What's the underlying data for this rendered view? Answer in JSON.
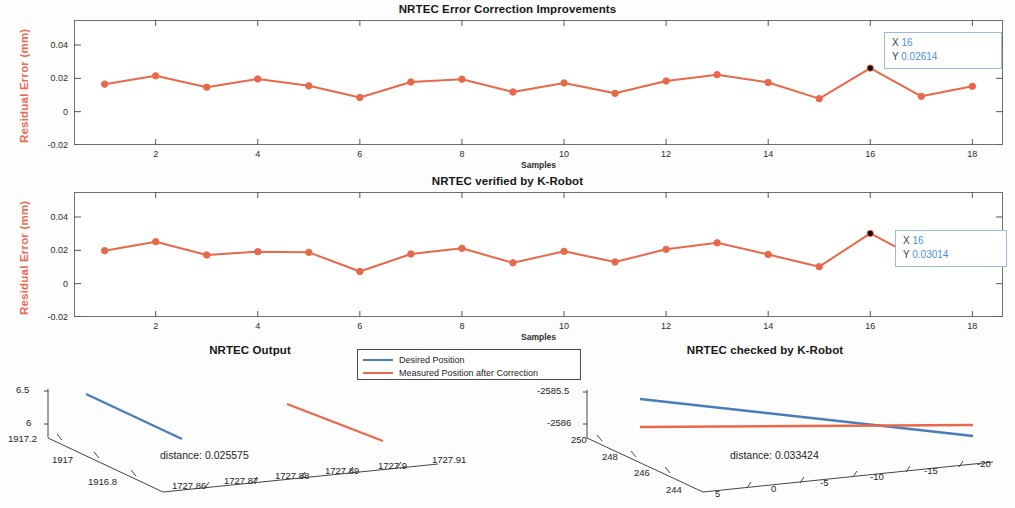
{
  "figure": {
    "width": 1015,
    "height": 508,
    "background": "#ffffff"
  },
  "colors": {
    "measured": "#e8684a",
    "desired": "#4a7ebb",
    "ylabel": "#eb6a52",
    "datatip_value": "#4a90d9",
    "axis": "#6f6f6f"
  },
  "legend": {
    "items": [
      {
        "label": "Desired Position",
        "color": "#4a7ebb"
      },
      {
        "label": "Measured Position after Correction",
        "color": "#e8684a"
      }
    ]
  },
  "chart_data": [
    {
      "type": "line",
      "id": "nrtec-error-correction",
      "title": "NRTEC Error Correction Improvements",
      "xlabel": "Samples",
      "ylabel": "Residual Error (mm)",
      "xlim": [
        0.4,
        18.6
      ],
      "ylim": [
        -0.02,
        0.055
      ],
      "xticks": [
        2,
        4,
        6,
        8,
        10,
        12,
        14,
        16,
        18
      ],
      "yticks": [
        0.04,
        0.02,
        0,
        -0.02
      ],
      "ytick_labels": [
        "0.04",
        "0.02",
        "0",
        "-0.02"
      ],
      "grid": false,
      "series": [
        {
          "name": "Residual Error",
          "color": "#e8684a",
          "marker": "o",
          "x": [
            1,
            2,
            3,
            4,
            5,
            6,
            7,
            8,
            9,
            10,
            11,
            12,
            13,
            14,
            15,
            16,
            17,
            18
          ],
          "values": [
            0.0165,
            0.0215,
            0.0147,
            0.0196,
            0.0155,
            0.0085,
            0.0178,
            0.0195,
            0.0118,
            0.0172,
            0.011,
            0.0184,
            0.0222,
            0.0175,
            0.0078,
            0.02614,
            0.0092,
            0.0152
          ]
        }
      ],
      "datatip": {
        "x_label": "X",
        "x_value": "16",
        "y_label": "Y",
        "y_value": "0.02614"
      }
    },
    {
      "type": "line",
      "id": "nrtec-verified-k-robot",
      "title": "NRTEC verified by K-Robot",
      "xlabel": "Samples",
      "ylabel": "Residual Error (mm)",
      "xlim": [
        0.4,
        18.6
      ],
      "ylim": [
        -0.02,
        0.055
      ],
      "xticks": [
        2,
        4,
        6,
        8,
        10,
        12,
        14,
        16,
        18
      ],
      "yticks": [
        0.04,
        0.02,
        0,
        -0.02
      ],
      "ytick_labels": [
        "0.04",
        "0.02",
        "0",
        "-0.02"
      ],
      "grid": false,
      "series": [
        {
          "name": "Residual Error",
          "color": "#e8684a",
          "marker": "o",
          "x": [
            1,
            2,
            3,
            4,
            5,
            6,
            7,
            8,
            9,
            10,
            11,
            12,
            13,
            14,
            15,
            16,
            17,
            18
          ],
          "values": [
            0.0198,
            0.0252,
            0.0172,
            0.0192,
            0.0188,
            0.0073,
            0.0178,
            0.0212,
            0.0125,
            0.0194,
            0.013,
            0.0206,
            0.0245,
            0.0175,
            0.0102,
            0.03014,
            0.014,
            0.0142
          ]
        }
      ],
      "datatip": {
        "x_label": "X",
        "x_value": "16",
        "y_label": "Y",
        "y_value": "0.03014"
      }
    },
    {
      "type": "line3d",
      "id": "nrtec-output",
      "title": "NRTEC Output",
      "annotation": "distance: 0.025575",
      "xticks": [
        "1727.86",
        "1727.87",
        "1727.88",
        "1727.89",
        "1727.9",
        "1727.91"
      ],
      "yticks": [
        "1917.2",
        "1917",
        "1916.8"
      ],
      "zticks": [
        "6.5",
        "6"
      ],
      "series": [
        {
          "name": "Desired Position",
          "color": "#4a7ebb"
        },
        {
          "name": "Measured Position after Correction",
          "color": "#e8684a"
        }
      ]
    },
    {
      "type": "line3d",
      "id": "nrtec-checked-k-robot",
      "title": "NRTEC checked by K-Robot",
      "annotation": "distance: 0.033424",
      "xticks": [
        "5",
        "0",
        "-5",
        "-10",
        "-15",
        "-20"
      ],
      "yticks": [
        "250",
        "248",
        "246",
        "244"
      ],
      "zticks": [
        "-2585.5",
        "-2586"
      ],
      "series": [
        {
          "name": "Desired Position",
          "color": "#4a7ebb"
        },
        {
          "name": "Measured Position after Correction",
          "color": "#e8684a"
        }
      ]
    }
  ]
}
